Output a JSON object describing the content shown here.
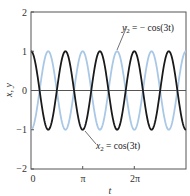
{
  "chart_data": {
    "type": "line",
    "title": "",
    "xlabel": "t",
    "ylabel": "x, y",
    "xlim": [
      0,
      9.42477796
    ],
    "ylim": [
      -2,
      2
    ],
    "grid": false,
    "legend": "none (inline annotations)",
    "x_ticks": [
      {
        "value": 0,
        "label": "0"
      },
      {
        "value": 3.14159265,
        "label": "π"
      },
      {
        "value": 6.28318531,
        "label": "2π"
      }
    ],
    "y_ticks": [
      {
        "value": -2,
        "label": "−2"
      },
      {
        "value": -1,
        "label": "−1"
      },
      {
        "value": 0,
        "label": "0"
      },
      {
        "value": 1,
        "label": "1"
      },
      {
        "value": 2,
        "label": "2"
      }
    ],
    "reference_lines": [
      {
        "axis": "y",
        "value": 0,
        "color": "#555555"
      }
    ],
    "series": [
      {
        "name": "x2 = cos(3t)",
        "expression": "cos(3t)",
        "color": "#1a1a1a",
        "width": 1.8,
        "x": [
          0,
          0.5236,
          1.0472,
          1.5708,
          2.0944,
          2.618,
          3.1416,
          3.6652,
          4.1888,
          4.7124,
          5.236,
          5.7596,
          6.2832,
          6.8068,
          7.3304,
          7.854,
          8.3776,
          8.9012,
          9.4248
        ],
        "values": [
          1,
          0,
          -1,
          0,
          1,
          0,
          -1,
          0,
          1,
          0,
          -1,
          0,
          1,
          0,
          -1,
          0,
          1,
          0,
          -1
        ]
      },
      {
        "name": "y2 = −cos(3t)",
        "expression": "-cos(3t)",
        "color": "#a9c8e6",
        "width": 1.8,
        "x": [
          0,
          0.5236,
          1.0472,
          1.5708,
          2.0944,
          2.618,
          3.1416,
          3.6652,
          4.1888,
          4.7124,
          5.236,
          5.7596,
          6.2832,
          6.8068,
          7.3304,
          7.854,
          8.3776,
          8.9012,
          9.4248
        ],
        "values": [
          -1,
          0,
          1,
          0,
          -1,
          0,
          1,
          0,
          -1,
          0,
          1,
          0,
          -1,
          0,
          1,
          0,
          -1,
          0,
          1
        ]
      }
    ],
    "annotations": [
      {
        "text": "y2 = − cos(3t)",
        "points_to": "y2 peak near t≈5π/3, y=1"
      },
      {
        "text": "x2 = cos(3t)",
        "points_to": "x2 trough near t≈π, y=−1"
      }
    ]
  },
  "labels": {
    "xlabel": "t",
    "ylabel": "x, y",
    "x_ticks": [
      "0",
      "π",
      "2π"
    ],
    "y_ticks": [
      "2",
      "1",
      "0",
      "−1",
      "−2"
    ],
    "ann_y2_var": "y",
    "ann_y2_sub": "2",
    "ann_y2_rhs": " = − cos(3t)",
    "ann_x2_var": "x",
    "ann_x2_sub": "2",
    "ann_x2_rhs": " = cos(3t)"
  }
}
